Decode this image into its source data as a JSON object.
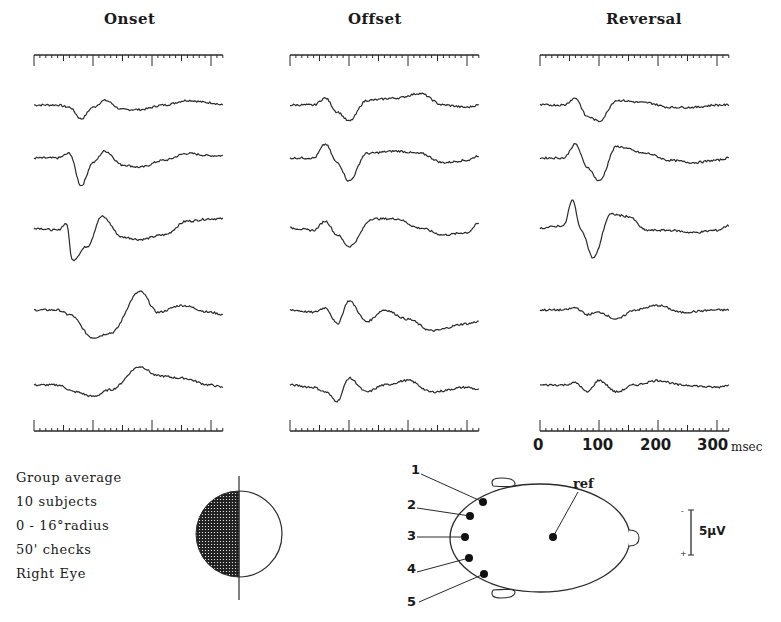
{
  "titles": {
    "onset": "Onset",
    "offset": "Offset",
    "reversal": "Reversal"
  },
  "time_axis": {
    "ticks": [
      "0",
      "100",
      "200",
      "300"
    ],
    "unit": "msec"
  },
  "legend": {
    "lines": [
      "Group average",
      "10 subjects",
      "0 - 16°radius",
      "50' checks",
      "Right Eye"
    ]
  },
  "electrodes": {
    "labels": [
      "1",
      "2",
      "3",
      "4",
      "5"
    ],
    "ref_label": "ref"
  },
  "scale_bar": {
    "label": "5µV",
    "minus": "-",
    "plus": "+"
  },
  "colors": {
    "trace": "#2a2a2a",
    "background": "#ffffff"
  },
  "chart_data": {
    "type": "line",
    "xlabel": "msec",
    "ylabel": "",
    "xlim": [
      0,
      320
    ],
    "x_ticks": [
      0,
      100,
      200,
      300
    ],
    "grid": false,
    "legend_position": "bottom-left",
    "panels": [
      "Onset",
      "Offset",
      "Reversal"
    ],
    "series_note": "5 traces per panel, one per electrode 1-5; amplitude in arbitrary units (negative up), scale bar 5 µV",
    "series": [
      {
        "panel": "Onset",
        "electrode": 1,
        "x": [
          0,
          40,
          60,
          80,
          100,
          120,
          150,
          180,
          220,
          260,
          300,
          320
        ],
        "values": [
          0,
          0,
          -1,
          -6,
          -1,
          2,
          -2,
          -2,
          0,
          2,
          1,
          0
        ]
      },
      {
        "panel": "Onset",
        "electrode": 2,
        "x": [
          0,
          40,
          60,
          80,
          100,
          120,
          150,
          180,
          220,
          260,
          300,
          320
        ],
        "values": [
          0,
          0,
          2,
          -12,
          -2,
          3,
          -3,
          -4,
          -1,
          2,
          1,
          1
        ]
      },
      {
        "panel": "Onset",
        "electrode": 3,
        "x": [
          0,
          40,
          55,
          65,
          90,
          115,
          150,
          180,
          220,
          260,
          300,
          320
        ],
        "values": [
          0,
          -1,
          2,
          -14,
          -8,
          5,
          -4,
          -5,
          -3,
          3,
          4,
          4
        ]
      },
      {
        "panel": "Onset",
        "electrode": 4,
        "x": [
          0,
          40,
          60,
          100,
          130,
          180,
          210,
          250,
          300,
          320
        ],
        "values": [
          0,
          0,
          -2,
          -12,
          -10,
          8,
          -1,
          2,
          -1,
          -2
        ]
      },
      {
        "panel": "Onset",
        "electrode": 5,
        "x": [
          0,
          40,
          70,
          100,
          130,
          180,
          210,
          250,
          300,
          320
        ],
        "values": [
          0,
          0,
          -3,
          -5,
          -2,
          8,
          4,
          3,
          0,
          -1
        ]
      },
      {
        "panel": "Offset",
        "electrode": 1,
        "x": [
          0,
          40,
          60,
          80,
          100,
          130,
          180,
          220,
          260,
          300,
          320
        ],
        "values": [
          0,
          0,
          3,
          -3,
          -7,
          2,
          3,
          5,
          0,
          -1,
          0
        ]
      },
      {
        "panel": "Offset",
        "electrode": 2,
        "x": [
          0,
          40,
          60,
          80,
          100,
          130,
          180,
          220,
          260,
          300,
          320
        ],
        "values": [
          0,
          0,
          6,
          -2,
          -10,
          2,
          3,
          2,
          -2,
          -1,
          1
        ]
      },
      {
        "panel": "Offset",
        "electrode": 3,
        "x": [
          0,
          40,
          60,
          80,
          100,
          140,
          180,
          220,
          260,
          300,
          320
        ],
        "values": [
          0,
          -1,
          3,
          -3,
          -8,
          4,
          4,
          0,
          -3,
          -2,
          2
        ]
      },
      {
        "panel": "Offset",
        "electrode": 4,
        "x": [
          0,
          40,
          60,
          80,
          100,
          130,
          160,
          200,
          240,
          300,
          320
        ],
        "values": [
          0,
          -1,
          1,
          -6,
          4,
          -5,
          0,
          -4,
          -9,
          -6,
          -5
        ]
      },
      {
        "panel": "Offset",
        "electrode": 5,
        "x": [
          0,
          40,
          60,
          80,
          100,
          130,
          160,
          200,
          240,
          300,
          320
        ],
        "values": [
          0,
          -1,
          -3,
          -7,
          3,
          -3,
          0,
          2,
          -3,
          -1,
          -2
        ]
      },
      {
        "panel": "Reversal",
        "electrode": 1,
        "x": [
          0,
          40,
          60,
          80,
          100,
          130,
          180,
          220,
          260,
          300,
          320
        ],
        "values": [
          0,
          0,
          3,
          -5,
          -7,
          2,
          1,
          -1,
          -1,
          0,
          0
        ]
      },
      {
        "panel": "Reversal",
        "electrode": 2,
        "x": [
          0,
          40,
          60,
          80,
          100,
          130,
          180,
          220,
          260,
          300,
          320
        ],
        "values": [
          0,
          0,
          6,
          -4,
          -10,
          5,
          2,
          -1,
          -2,
          -1,
          0
        ]
      },
      {
        "panel": "Reversal",
        "electrode": 3,
        "x": [
          0,
          40,
          55,
          70,
          90,
          120,
          150,
          180,
          220,
          260,
          300,
          320
        ],
        "values": [
          0,
          1,
          12,
          -1,
          -13,
          6,
          5,
          -1,
          -1,
          -2,
          -1,
          1
        ]
      },
      {
        "panel": "Reversal",
        "electrode": 4,
        "x": [
          0,
          40,
          60,
          80,
          100,
          130,
          160,
          200,
          240,
          300,
          320
        ],
        "values": [
          0,
          0,
          1,
          -2,
          -1,
          -4,
          0,
          2,
          -1,
          0,
          0
        ]
      },
      {
        "panel": "Reversal",
        "electrode": 5,
        "x": [
          0,
          40,
          60,
          80,
          100,
          130,
          160,
          200,
          240,
          300,
          320
        ],
        "values": [
          0,
          0,
          1,
          -3,
          2,
          -3,
          0,
          2,
          0,
          -1,
          0
        ]
      }
    ]
  }
}
